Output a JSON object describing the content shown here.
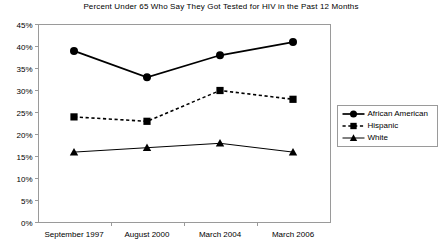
{
  "chart_data": {
    "type": "line",
    "title": "Percent Under 65 Who Say They Got Tested for HIV in the Past 12 Months",
    "xlabel": "",
    "ylabel": "",
    "categories": [
      "September 1997",
      "August 2000",
      "March 2004",
      "March 2006"
    ],
    "ylim": [
      0,
      45
    ],
    "ytick_labels": [
      "0%",
      "5%",
      "10%",
      "15%",
      "20%",
      "25%",
      "30%",
      "35%",
      "40%",
      "45%"
    ],
    "ytick_values": [
      0,
      5,
      10,
      15,
      20,
      25,
      30,
      35,
      40,
      45
    ],
    "grid": false,
    "legend_position": "right",
    "series": [
      {
        "name": "African American",
        "values": [
          39,
          33,
          38,
          41
        ],
        "marker": "circle",
        "line_style": "solid",
        "color": "#000000"
      },
      {
        "name": "Hispanic",
        "values": [
          24,
          23,
          30,
          28
        ],
        "marker": "square",
        "line_style": "dashed",
        "color": "#000000"
      },
      {
        "name": "White",
        "values": [
          16,
          17,
          18,
          16
        ],
        "marker": "triangle",
        "line_style": "solid",
        "color": "#000000"
      }
    ]
  },
  "legend": {
    "items": [
      {
        "label": "African American"
      },
      {
        "label": "Hispanic"
      },
      {
        "label": "White"
      }
    ]
  }
}
